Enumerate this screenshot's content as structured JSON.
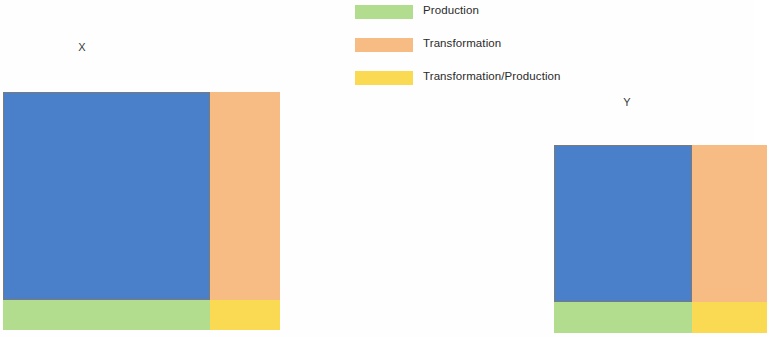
{
  "legend": {
    "items": [
      {
        "label": "Production",
        "color": "#b2dd8e",
        "icon": "legend-swatch-green"
      },
      {
        "label": "Transformation",
        "color": "#f7bc84",
        "icon": "legend-swatch-orange"
      },
      {
        "label": "Transformation/Production",
        "color": "#fada52",
        "icon": "legend-swatch-yellow"
      }
    ]
  },
  "colors": {
    "blue": "#4a80ca",
    "orange": "#f7bc84",
    "green": "#b2dd8e",
    "yellow": "#fada52",
    "border": "#7a7a7a",
    "background": "#ffffff"
  },
  "charts": [
    {
      "title": "X",
      "cells": [
        {
          "name": "large-blue-block",
          "color": "#4a80ca",
          "x": 0.0,
          "y": 0.0,
          "w": 0.747,
          "h": 0.874
        },
        {
          "name": "orange-column",
          "color": "#f7bc84",
          "x": 0.747,
          "y": 0.0,
          "w": 0.253,
          "h": 0.874
        },
        {
          "name": "green-row",
          "color": "#b2dd8e",
          "x": 0.0,
          "y": 0.874,
          "w": 0.747,
          "h": 0.126
        },
        {
          "name": "yellow-corner",
          "color": "#fada52",
          "x": 0.747,
          "y": 0.874,
          "w": 0.253,
          "h": 0.126
        }
      ]
    },
    {
      "title": "Y",
      "cells": [
        {
          "name": "large-blue-block",
          "color": "#4a80ca",
          "x": 0.0,
          "y": 0.0,
          "w": 0.648,
          "h": 0.835
        },
        {
          "name": "orange-column",
          "color": "#f7bc84",
          "x": 0.648,
          "y": 0.0,
          "w": 0.352,
          "h": 0.835
        },
        {
          "name": "green-row",
          "color": "#b2dd8e",
          "x": 0.0,
          "y": 0.835,
          "w": 0.648,
          "h": 0.165
        },
        {
          "name": "yellow-corner",
          "color": "#fada52",
          "x": 0.648,
          "y": 0.835,
          "w": 0.352,
          "h": 0.165
        }
      ]
    }
  ],
  "chart_data": {
    "type": "heatmap",
    "title": "",
    "subtitle": "",
    "xlabel": "",
    "ylabel": "",
    "grid": false,
    "legend_position": "top-center",
    "legend_entries": [
      "Production",
      "Transformation",
      "Transformation/Production"
    ],
    "panels": [
      {
        "name": "X",
        "width_fractions": [
          0.747,
          0.253
        ],
        "height_fractions": [
          0.874,
          0.126
        ],
        "tiles": [
          {
            "category": "base",
            "color": "#4a80ca",
            "width_fraction": 0.747,
            "height_fraction": 0.874,
            "area_fraction": 0.653
          },
          {
            "category": "Transformation",
            "color": "#f7bc84",
            "width_fraction": 0.253,
            "height_fraction": 0.874,
            "area_fraction": 0.221
          },
          {
            "category": "Production",
            "color": "#b2dd8e",
            "width_fraction": 0.747,
            "height_fraction": 0.126,
            "area_fraction": 0.094
          },
          {
            "category": "Transformation/Production",
            "color": "#fada52",
            "width_fraction": 0.253,
            "height_fraction": 0.126,
            "area_fraction": 0.032
          }
        ]
      },
      {
        "name": "Y",
        "width_fractions": [
          0.648,
          0.352
        ],
        "height_fractions": [
          0.835,
          0.165
        ],
        "tiles": [
          {
            "category": "base",
            "color": "#4a80ca",
            "width_fraction": 0.648,
            "height_fraction": 0.835,
            "area_fraction": 0.541
          },
          {
            "category": "Transformation",
            "color": "#f7bc84",
            "width_fraction": 0.352,
            "height_fraction": 0.835,
            "area_fraction": 0.294
          },
          {
            "category": "Production",
            "color": "#b2dd8e",
            "width_fraction": 0.648,
            "height_fraction": 0.165,
            "area_fraction": 0.107
          },
          {
            "category": "Transformation/Production",
            "color": "#fada52",
            "width_fraction": 0.352,
            "height_fraction": 0.165,
            "area_fraction": 0.058
          }
        ]
      }
    ]
  }
}
